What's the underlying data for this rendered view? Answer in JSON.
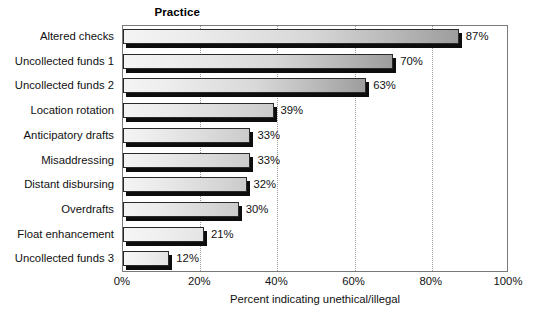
{
  "chart_data": {
    "type": "bar",
    "orientation": "horizontal",
    "title": "",
    "category_axis_title": "Practice",
    "xlabel": "Percent indicating unethical/illegal",
    "ylabel": "Practice",
    "xlim": [
      0,
      100
    ],
    "xticks": [
      "0%",
      "20%",
      "40%",
      "60%",
      "80%",
      "100%"
    ],
    "xtick_values": [
      0,
      20,
      40,
      60,
      80,
      100
    ],
    "grid": "vertical-dotted",
    "legend": "none",
    "categories": [
      "Altered checks",
      "Uncollected funds 1",
      "Uncollected funds 2",
      "Location rotation",
      "Anticipatory drafts",
      "Misaddressing",
      "Distant disbursing",
      "Overdrafts",
      "Float enhancement",
      "Uncollected funds 3"
    ],
    "values": [
      87,
      70,
      63,
      39,
      33,
      33,
      32,
      30,
      21,
      12
    ],
    "value_labels": [
      "87%",
      "70%",
      "63%",
      "39%",
      "33%",
      "33%",
      "32%",
      "30%",
      "21%",
      "12%"
    ],
    "bars": [
      {
        "category": "Altered checks",
        "value": 87,
        "label": "87%"
      },
      {
        "category": "Uncollected funds 1",
        "value": 70,
        "label": "70%"
      },
      {
        "category": "Uncollected funds 2",
        "value": 63,
        "label": "63%"
      },
      {
        "category": "Location rotation",
        "value": 39,
        "label": "39%"
      },
      {
        "category": "Anticipatory drafts",
        "value": 33,
        "label": "33%"
      },
      {
        "category": "Misaddressing",
        "value": 33,
        "label": "33%"
      },
      {
        "category": "Distant disbursing",
        "value": 32,
        "label": "32%"
      },
      {
        "category": "Overdrafts",
        "value": 30,
        "label": "30%"
      },
      {
        "category": "Float enhancement",
        "value": 21,
        "label": "21%"
      },
      {
        "category": "Uncollected funds 3",
        "value": 12,
        "label": "12%"
      }
    ],
    "colors": {
      "bar_fill_light": "#f4f4f4",
      "bar_fill_dark": "#9d9d9d",
      "bar_outline": "#2a2a2a",
      "bar_shadow": "#0d0d0d",
      "gridline": "#9a9a9a",
      "plot_border": "#7a7a7a",
      "text": "#111111",
      "background": "#ffffff"
    }
  }
}
